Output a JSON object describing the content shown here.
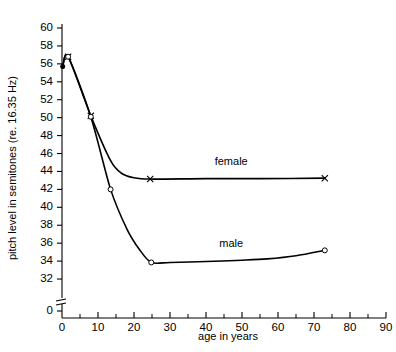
{
  "chart_data": {
    "type": "line",
    "title": "",
    "xlabel": "age  in  years",
    "ylabel": "pitch level in semitones (re. 16.35 Hz)",
    "xlim": [
      0,
      90
    ],
    "ylim": [
      30.6,
      60
    ],
    "grid": false,
    "legend_position": "inline-annotation",
    "y_axis_break": true,
    "y_axis_break_note": "axis broken between 0 and 31",
    "xticks_major": [
      0,
      10,
      20,
      30,
      40,
      50,
      60,
      70,
      80,
      90
    ],
    "xticks_minor": [
      5,
      15,
      25,
      35,
      45,
      55,
      65,
      75,
      85
    ],
    "yticks_major": [
      32,
      34,
      36,
      38,
      40,
      42,
      44,
      46,
      48,
      50,
      52,
      54,
      56,
      58,
      60
    ],
    "yticks_extra": [
      0
    ],
    "xtick_labels": [
      "0",
      "10",
      "20",
      "30",
      "40",
      "50",
      "60",
      "70",
      "80",
      "90"
    ],
    "ytick_labels": [
      "0",
      "32",
      "34",
      "36",
      "38",
      "40",
      "42",
      "44",
      "46",
      "48",
      "50",
      "52",
      "54",
      "56",
      "58",
      "60"
    ],
    "series": [
      {
        "name": "female",
        "label": "female",
        "marker": "x",
        "label_x": 47,
        "label_y": 44.7,
        "x": [
          0.2,
          1.7,
          8.0,
          13.5,
          16.5,
          20.0,
          24.5,
          40.0,
          55.0,
          73.0
        ],
        "y": [
          55.7,
          56.8,
          50.2,
          45.2,
          43.8,
          43.3,
          43.15,
          43.2,
          43.2,
          43.25
        ],
        "marker_points": [
          {
            "x": 0.2,
            "y": 55.7,
            "style": "dot"
          },
          {
            "x": 1.7,
            "y": 56.8,
            "style": "x"
          },
          {
            "x": 8.0,
            "y": 50.2,
            "style": "x"
          },
          {
            "x": 24.5,
            "y": 43.15,
            "style": "x"
          },
          {
            "x": 73.0,
            "y": 43.25,
            "style": "x"
          }
        ]
      },
      {
        "name": "male",
        "label": "male",
        "marker": "o",
        "label_x": 47,
        "label_y": 35.6,
        "x": [
          0.2,
          1.7,
          8.0,
          13.5,
          18.0,
          21.5,
          24.8,
          30.0,
          40.0,
          50.0,
          57.0,
          65.0,
          73.0
        ],
        "y": [
          55.7,
          56.8,
          50.1,
          42.0,
          37.6,
          35.3,
          33.85,
          33.85,
          33.95,
          34.1,
          34.25,
          34.6,
          35.2
        ],
        "marker_points": [
          {
            "x": 0.2,
            "y": 55.7,
            "style": "dot"
          },
          {
            "x": 1.7,
            "y": 56.8,
            "style": "o"
          },
          {
            "x": 8.0,
            "y": 50.1,
            "style": "o"
          },
          {
            "x": 13.5,
            "y": 42.0,
            "style": "o"
          },
          {
            "x": 24.8,
            "y": 33.85,
            "style": "o"
          },
          {
            "x": 73.0,
            "y": 35.2,
            "style": "o"
          }
        ]
      }
    ]
  }
}
